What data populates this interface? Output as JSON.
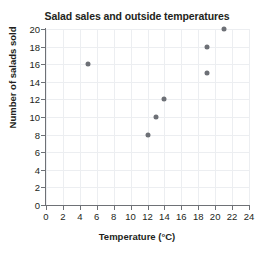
{
  "clipped_text": "",
  "chart_data": {
    "type": "scatter",
    "title": "Salad sales and outside temperatures",
    "xlabel": "Temperature (°C)",
    "ylabel": "Number of salads sold",
    "xlim": [
      0,
      24
    ],
    "ylim": [
      0,
      20
    ],
    "xticks": [
      "0",
      "2",
      "4",
      "6",
      "8",
      "10",
      "12",
      "14",
      "16",
      "18",
      "20",
      "22",
      "24"
    ],
    "yticks": [
      "0",
      "2",
      "4",
      "6",
      "8",
      "10",
      "12",
      "14",
      "16",
      "18",
      "20"
    ],
    "grid": true,
    "legend": "none",
    "point_color": "#6d7076",
    "points": [
      {
        "x": 5,
        "y": 16
      },
      {
        "x": 12,
        "y": 8
      },
      {
        "x": 13,
        "y": 10
      },
      {
        "x": 14,
        "y": 12
      },
      {
        "x": 19,
        "y": 15
      },
      {
        "x": 19,
        "y": 18
      },
      {
        "x": 21,
        "y": 20
      }
    ]
  }
}
